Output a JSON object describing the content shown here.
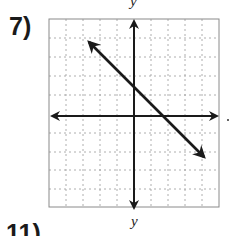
{
  "problems": [
    {
      "number_label": "7)"
    },
    {
      "number_label": "11)"
    }
  ],
  "graph": {
    "y_axis_label": "y",
    "x_axis_label": "x",
    "grid": {
      "x_min": -5,
      "x_max": 5,
      "y_min": -5,
      "y_max": 5
    }
  },
  "next_graph": {
    "y_axis_label": "y"
  },
  "colors": {
    "ink": "#1a1a1a",
    "grid": "#9a9a9a",
    "border": "#8a8a8a"
  }
}
